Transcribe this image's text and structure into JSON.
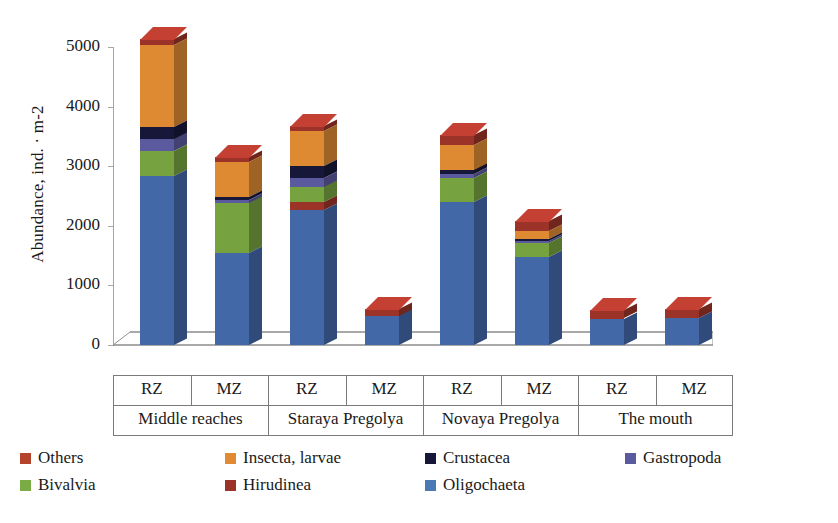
{
  "chart_data": {
    "type": "bar",
    "subtype": "stacked-3d-column",
    "title": "",
    "xlabel": "",
    "ylabel": "Abundance, ind. · m-2",
    "ylim": [
      0,
      5000
    ],
    "yticks": [
      0,
      1000,
      2000,
      3000,
      4000,
      5000
    ],
    "ytick_labels": [
      "0",
      "1000",
      "2000",
      "3000",
      "4000",
      "5000"
    ],
    "grid": false,
    "legend_position": "bottom",
    "group_labels": [
      "Middle reaches",
      "Staraya Pregolya",
      "Novaya Pregolya",
      "The mouth"
    ],
    "zone_labels": [
      "RZ",
      "MZ"
    ],
    "categories": [
      "Middle reaches RZ",
      "Middle reaches MZ",
      "Staraya Pregolya RZ",
      "Staraya Pregolya MZ",
      "Novaya Pregolya RZ",
      "Novaya Pregolya MZ",
      "The mouth RZ",
      "The mouth MZ"
    ],
    "series": [
      {
        "name": "Oligochaeta",
        "color": "#4268a8",
        "values": [
          2830,
          1540,
          2270,
          480,
          2400,
          1480,
          440,
          450
        ]
      },
      {
        "name": "Hirudinea",
        "color": "#9c3328",
        "values": [
          0,
          0,
          130,
          0,
          0,
          0,
          0,
          0
        ]
      },
      {
        "name": "Bivalvia",
        "color": "#76a340",
        "values": [
          420,
          840,
          250,
          0,
          400,
          230,
          0,
          0
        ]
      },
      {
        "name": "Gastropoda",
        "color": "#5b5a9e",
        "values": [
          200,
          60,
          160,
          0,
          70,
          40,
          0,
          0
        ]
      },
      {
        "name": "Crustacea",
        "color": "#17173a",
        "values": [
          210,
          50,
          200,
          0,
          60,
          30,
          0,
          0
        ]
      },
      {
        "name": "Insecta, larvae",
        "color": "#dd8a33",
        "values": [
          1380,
          580,
          580,
          0,
          430,
          130,
          0,
          0
        ]
      },
      {
        "name": "Others",
        "color": "#9c3328",
        "values": [
          100,
          90,
          80,
          130,
          160,
          170,
          140,
          150
        ]
      }
    ],
    "totals": [
      5140,
      3160,
      3670,
      610,
      3520,
      2080,
      580,
      600
    ],
    "annotations": []
  },
  "legend": {
    "items": [
      {
        "label": "Others",
        "color": "#b5442c"
      },
      {
        "label": "Insecta, larvae",
        "color": "#e08b33"
      },
      {
        "label": "Crustacea",
        "color": "#17173a"
      },
      {
        "label": "Gastropoda",
        "color": "#5b5a9e"
      },
      {
        "label": "Bivalvia",
        "color": "#7aab44"
      },
      {
        "label": "Hirudinea",
        "color": "#9c3328"
      },
      {
        "label": "Oligochaeta",
        "color": "#4a79b5"
      }
    ]
  },
  "axis": {
    "y_title": "Abundance, ind. · m-2",
    "ticks": [
      "5000",
      "4000",
      "3000",
      "2000",
      "1000",
      "0"
    ]
  },
  "xaxis": {
    "cells": [
      {
        "zone": "RZ",
        "group": "Middle reaches"
      },
      {
        "zone": "MZ",
        "group": "Middle reaches"
      },
      {
        "zone": "RZ",
        "group": "Staraya Pregolya"
      },
      {
        "zone": "MZ",
        "group": "Staraya Pregolya"
      },
      {
        "zone": "RZ",
        "group": "Novaya Pregolya"
      },
      {
        "zone": "MZ",
        "group": "Novaya Pregolya"
      },
      {
        "zone": "RZ",
        "group": "The mouth"
      },
      {
        "zone": "MZ",
        "group": "The mouth"
      }
    ],
    "groups": [
      "Middle reaches",
      "Staraya Pregolya",
      "Novaya Pregolya",
      "The mouth"
    ]
  }
}
